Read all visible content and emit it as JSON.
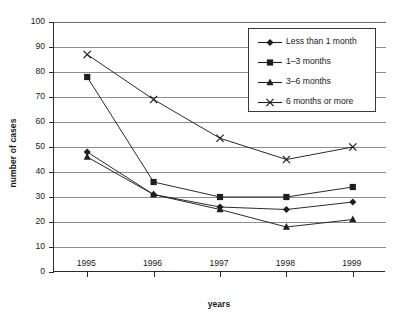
{
  "chart_data": {
    "type": "line",
    "title": "",
    "xlabel": "years",
    "ylabel": "number of cases",
    "categories": [
      "1995",
      "1996",
      "1997",
      "1998",
      "1999"
    ],
    "x": [
      1995,
      1996,
      1997,
      1998,
      1999
    ],
    "ylim": [
      0,
      100
    ],
    "ytick_labels": [
      "0",
      "10",
      "20",
      "30",
      "40",
      "50",
      "60",
      "70",
      "80",
      "90",
      "100"
    ],
    "ytick_values": [
      0,
      10,
      20,
      30,
      40,
      50,
      60,
      70,
      80,
      90,
      100
    ],
    "ytick_step": 10,
    "grid": "horizontal",
    "legend_position": "upper-right-inside",
    "series": [
      {
        "name": "Less than 1 month",
        "marker": "diamond",
        "color": "#1f1f1f",
        "values": [
          48,
          31,
          26,
          25,
          28
        ]
      },
      {
        "name": "1–3 months",
        "marker": "square",
        "color": "#1f1f1f",
        "values": [
          78,
          36,
          30,
          30,
          34
        ]
      },
      {
        "name": "3–6 months",
        "marker": "triangle",
        "color": "#1f1f1f",
        "values": [
          46,
          31,
          25,
          18,
          21
        ]
      },
      {
        "name": "6 months or more",
        "marker": "cross",
        "color": "#1f1f1f",
        "values": [
          87,
          69,
          53.5,
          45,
          50
        ]
      }
    ]
  },
  "axes": {
    "y_title": "number of cases",
    "x_title": "years",
    "y_ticks": [
      "100",
      "90",
      "80",
      "70",
      "60",
      "50",
      "40",
      "30",
      "20",
      "10",
      "0"
    ],
    "x_ticks": [
      "1995",
      "1996",
      "1997",
      "1998",
      "1999"
    ]
  },
  "legend": {
    "items": [
      {
        "label": "Less than 1 month",
        "marker": "diamond-marker"
      },
      {
        "label": "1–3 months",
        "marker": "square-marker"
      },
      {
        "label": "3–6 months",
        "marker": "triangle-marker"
      },
      {
        "label": "6 months or more",
        "marker": "cross-marker"
      }
    ]
  },
  "colors": {
    "line": "#1f1f1f",
    "grid": "#8d8d8d",
    "axis": "#2b2b2b",
    "background": "#ffffff"
  }
}
